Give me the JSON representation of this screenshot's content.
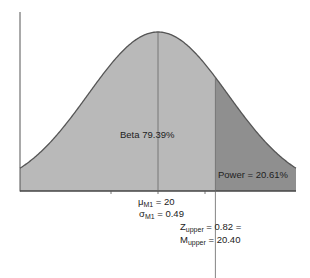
{
  "chart_data": {
    "type": "area",
    "title": "",
    "distribution": "normal",
    "mean": 20,
    "sd": 0.49,
    "cutoff": 20.4,
    "z_cutoff": 0.82,
    "regions": [
      {
        "name": "Beta",
        "percent": 79.39,
        "color": "#b9b9b9"
      },
      {
        "name": "Power",
        "percent": 20.61,
        "color": "#8f8f8f"
      }
    ],
    "annotations": {
      "beta": "Beta 79.39%",
      "power": "Power = 20.61%",
      "mu_main": "μ",
      "mu_sub": "M1",
      "mu_val": " = 20",
      "sigma_main": "σ",
      "sigma_sub": "M1",
      "sigma_val": " = 0.49",
      "z_main": "Z",
      "z_sub": "upper",
      "z_val": " = 0.82 =",
      "m_main": "M",
      "m_sub": "upper",
      "m_val": " = 20.40"
    },
    "xlabel": "",
    "ylabel": "",
    "grid": false
  }
}
